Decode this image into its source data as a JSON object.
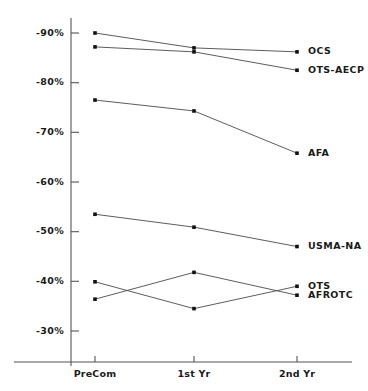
{
  "chart_data": {
    "type": "line",
    "title": "",
    "subtitle": "",
    "xlabel": "",
    "ylabel": "",
    "categories": [
      "PreCom",
      "1st Yr",
      "2nd Yr"
    ],
    "ytick_labels": [
      "-90%",
      "-80%",
      "-70%",
      "-60%",
      "-50%",
      "-40%",
      "-30%"
    ],
    "ytick_values": [
      -90,
      -80,
      -70,
      -60,
      -50,
      -40,
      -30
    ],
    "ylim": [
      -28,
      -92
    ],
    "grid": false,
    "legend_position": "right-inline",
    "series": [
      {
        "name": "OCS",
        "label": "OCS",
        "values": [
          -90.0,
          -87.0,
          -86.2
        ]
      },
      {
        "name": "OTS-AECP",
        "label": "OTS-AECP",
        "values": [
          -87.2,
          -86.2,
          -82.5
        ]
      },
      {
        "name": "AFA",
        "label": "AFA",
        "values": [
          -76.5,
          -74.3,
          -65.8
        ]
      },
      {
        "name": "USMA-NA",
        "label": "USMA-NA",
        "values": [
          -53.5,
          -50.9,
          -47.0
        ]
      },
      {
        "name": "OTS",
        "label": "OTS",
        "values": [
          -39.9,
          -34.5,
          -39.0
        ]
      },
      {
        "name": "AFROTC",
        "label": "AFROTC",
        "values": [
          -36.4,
          -41.8,
          -37.2
        ]
      }
    ],
    "colors": {
      "line": "#4a4a4a",
      "marker": "#111111",
      "axis": "#555555",
      "text": "#1a1a1a",
      "background": "#ffffff"
    }
  }
}
